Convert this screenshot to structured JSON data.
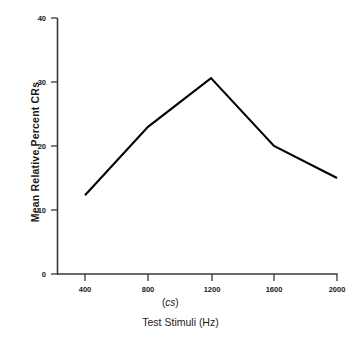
{
  "chart_data": {
    "type": "line",
    "title": "",
    "xlabel": "Test Stimuli (Hz)",
    "ylabel": "Mean Relative Percent CRs",
    "annotation": "(cs)",
    "x": [
      400,
      800,
      1200,
      1600,
      2000
    ],
    "categories": [
      "400",
      "800",
      "1200",
      "1600",
      "2000"
    ],
    "values": [
      12.3,
      23,
      30.6,
      20,
      15
    ],
    "series": [
      {
        "name": "Mean Relative Percent CRs",
        "values": [
          12.3,
          23,
          30.6,
          20,
          15
        ]
      }
    ],
    "xlim": [
      400,
      2000
    ],
    "ylim": [
      0,
      40
    ],
    "xticks": [
      "400",
      "800",
      "1200",
      "1600",
      "2000"
    ],
    "yticks": [
      "0",
      "10",
      "20",
      "30",
      "40"
    ],
    "grid": false,
    "legend": "none",
    "line_color": "#000000",
    "axis_color": "#3a3a3a",
    "background": "#ffffff"
  },
  "axes": {
    "y_tick_labels": [
      "40",
      "30",
      "20",
      "10",
      "0"
    ],
    "x_tick_labels": [
      "400",
      "800",
      "1200",
      "1600",
      "2000"
    ],
    "y_title": "Mean Relative Percent CRs",
    "x_title": "Test Stimuli (Hz)",
    "x_annotation_open": "(",
    "x_annotation_italic": "cs",
    "x_annotation_close": ")"
  },
  "caption": {
    "partial_text": ""
  }
}
